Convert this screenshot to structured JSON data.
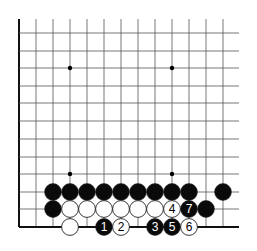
{
  "diagram": {
    "type": "go-board-fragment",
    "grid": {
      "columns": 13,
      "rows": 12,
      "col_x": [
        19,
        36,
        53,
        70,
        87,
        104,
        121,
        138,
        155,
        172,
        189,
        206,
        223
      ],
      "row_y": [
        33,
        51,
        68,
        86,
        103,
        121,
        139,
        157,
        174,
        192,
        209,
        227
      ],
      "right_extent_x": 239,
      "top_extent_y": 19,
      "left_edge_thick": true,
      "bottom_edge_thick": true
    },
    "star_points": [
      {
        "col": 3,
        "row": 2
      },
      {
        "col": 9,
        "row": 2
      },
      {
        "col": 3,
        "row": 8
      },
      {
        "col": 9,
        "row": 8
      }
    ],
    "stones": [
      {
        "color": "black",
        "col": 2,
        "row": 9,
        "label": ""
      },
      {
        "color": "black",
        "col": 3,
        "row": 9,
        "label": ""
      },
      {
        "color": "black",
        "col": 4,
        "row": 9,
        "label": ""
      },
      {
        "color": "black",
        "col": 5,
        "row": 9,
        "label": ""
      },
      {
        "color": "black",
        "col": 6,
        "row": 9,
        "label": ""
      },
      {
        "color": "black",
        "col": 7,
        "row": 9,
        "label": ""
      },
      {
        "color": "black",
        "col": 8,
        "row": 9,
        "label": ""
      },
      {
        "color": "black",
        "col": 9,
        "row": 9,
        "label": ""
      },
      {
        "color": "black",
        "col": 10,
        "row": 9,
        "label": ""
      },
      {
        "color": "black",
        "col": 12,
        "row": 9,
        "label": ""
      },
      {
        "color": "black",
        "col": 2,
        "row": 10,
        "label": ""
      },
      {
        "color": "white",
        "col": 3,
        "row": 10,
        "label": ""
      },
      {
        "color": "white",
        "col": 4,
        "row": 10,
        "label": ""
      },
      {
        "color": "white",
        "col": 5,
        "row": 10,
        "label": ""
      },
      {
        "color": "white",
        "col": 6,
        "row": 10,
        "label": ""
      },
      {
        "color": "white",
        "col": 7,
        "row": 10,
        "label": ""
      },
      {
        "color": "white",
        "col": 8,
        "row": 10,
        "label": ""
      },
      {
        "color": "white",
        "col": 9,
        "row": 10,
        "label": "4"
      },
      {
        "color": "black",
        "col": 10,
        "row": 10,
        "label": "7"
      },
      {
        "color": "black",
        "col": 11,
        "row": 10,
        "label": ""
      },
      {
        "color": "white",
        "col": 3,
        "row": 11,
        "label": ""
      },
      {
        "color": "black",
        "col": 5,
        "row": 11,
        "label": "1"
      },
      {
        "color": "white",
        "col": 6,
        "row": 11,
        "label": "2"
      },
      {
        "color": "black",
        "col": 8,
        "row": 11,
        "label": "3"
      },
      {
        "color": "black",
        "col": 9,
        "row": 11,
        "label": "5"
      },
      {
        "color": "white",
        "col": 10,
        "row": 11,
        "label": "6"
      }
    ],
    "colors": {
      "line": "#555555",
      "edge": "#111111",
      "black_stone": "#0a0a0a",
      "white_stone": "#ffffff",
      "stone_outline": "#222222"
    }
  }
}
